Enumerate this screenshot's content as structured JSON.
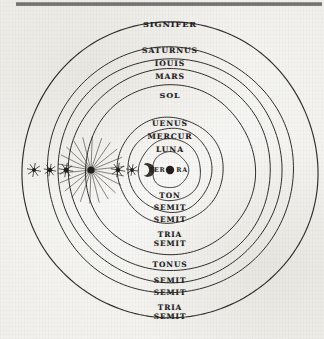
{
  "diagram": {
    "title": "Signifer",
    "center_label": "TERRA",
    "center_label_left": "TER",
    "center_label_right": "RA",
    "ink_color": "#211f1b",
    "paper_color": "#f3f3f1",
    "center": {
      "x": 170,
      "y": 170
    },
    "spheres": [
      {
        "name": "signifer",
        "label": "SIGNIFER",
        "radius": 148,
        "label_y": 24
      },
      {
        "name": "saturnus",
        "label": "SATURNUS",
        "radius": 123,
        "label_y": 51
      },
      {
        "name": "iouis",
        "label": "IOUIS",
        "radius": 112,
        "label_y": 64
      },
      {
        "name": "mars",
        "label": "MARS",
        "radius": 101,
        "label_y": 77
      },
      {
        "name": "sol",
        "label": "SOL",
        "radius": 85,
        "label_y": 95
      },
      {
        "name": "uenus",
        "label": "UENUS",
        "radius": 53,
        "label_y": 124
      },
      {
        "name": "mercur",
        "label": "MERCUR",
        "radius": 42,
        "label_y": 137
      },
      {
        "name": "luna",
        "label": "LUNA",
        "radius": 31,
        "label_y": 150
      },
      {
        "name": "terra-ring",
        "label": "",
        "radius": 18,
        "label_y": 0
      }
    ],
    "interval_labels": [
      {
        "name": "interval-ton",
        "label": "TON",
        "y": 196
      },
      {
        "name": "interval-semit-1",
        "label": "SEMIT",
        "y": 208
      },
      {
        "name": "interval-semit-2",
        "label": "SEMIT",
        "y": 220
      },
      {
        "name": "interval-tria-semit-1",
        "label": "TRIA\nSEMIT",
        "y": 239
      },
      {
        "name": "interval-tonus",
        "label": "TONUS",
        "y": 265
      },
      {
        "name": "interval-semit-3",
        "label": "SEMIT",
        "y": 281
      },
      {
        "name": "interval-semit-4",
        "label": "SEMIT",
        "y": 293
      },
      {
        "name": "interval-tria-semit-2",
        "label": "TRIA\nSEMIT",
        "y": 312
      }
    ],
    "star_glyphs": [
      {
        "name": "star-glyph-1",
        "x": 34,
        "y": 170,
        "size": 5.0,
        "rays": 8,
        "ray_len": 5,
        "core": 2.1
      },
      {
        "name": "star-glyph-2",
        "x": 50,
        "y": 170,
        "size": 4.2,
        "rays": 8,
        "ray_len": 4,
        "core": 2.3
      },
      {
        "name": "star-glyph-3",
        "x": 66,
        "y": 170,
        "size": 5.2,
        "rays": 8,
        "ray_len": 5,
        "core": 2.4
      },
      {
        "name": "star-glyph-radiant",
        "x": 91,
        "y": 170,
        "size": 11.0,
        "rays": 22,
        "ray_len": 30,
        "core": 3.6
      },
      {
        "name": "star-glyph-4",
        "x": 118,
        "y": 170,
        "size": 5.0,
        "rays": 8,
        "ray_len": 5,
        "core": 2.3
      },
      {
        "name": "star-glyph-5",
        "x": 132,
        "y": 170,
        "size": 4.4,
        "rays": 8,
        "ray_len": 4,
        "core": 2.0
      }
    ],
    "crescent": {
      "name": "crescent-glyph",
      "x": 145,
      "y": 170,
      "radius": 5.5
    },
    "center_dot": {
      "name": "center-dot",
      "x": 170,
      "y": 170,
      "radius": 4.2
    }
  }
}
